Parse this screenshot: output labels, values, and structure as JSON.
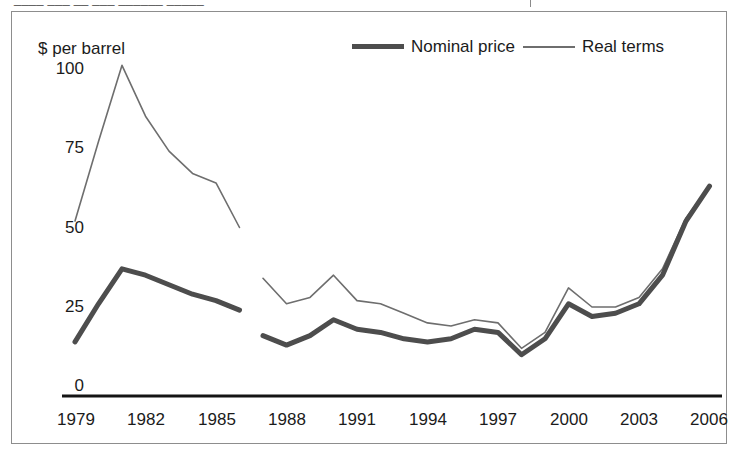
{
  "figure": {
    "clipped_header_text": "____ ___ __ ___ ______ _____",
    "background_color": "#ffffff",
    "border_color": "#8d8d8d"
  },
  "legend": {
    "position": "top-right",
    "items": [
      {
        "label": "Nominal price",
        "color": "#4d4d4d",
        "style": "thick-line",
        "swatch_icon": "thick-line-swatch-icon"
      },
      {
        "label": "Real terms",
        "color": "#6e6e6e",
        "style": "thin-line",
        "swatch_icon": "thin-line-swatch-icon"
      }
    ]
  },
  "axes": {
    "y_title": "$ per barrel",
    "y_ticks": [
      "100",
      "75",
      "50",
      "25",
      "0"
    ],
    "x_ticks": [
      "1979",
      "1982",
      "1985",
      "1988",
      "1991",
      "1994",
      "1997",
      "2000",
      "2003",
      "2006"
    ]
  },
  "chart_data": {
    "type": "line",
    "title": "",
    "subtitle": "",
    "xlabel": "",
    "ylabel": "$ per barrel",
    "ylim": [
      0,
      110
    ],
    "xlim": [
      1979,
      2006
    ],
    "ytick_values": [
      0,
      25,
      50,
      75,
      100
    ],
    "xtick_values": [
      1979,
      1982,
      1985,
      1988,
      1991,
      1994,
      1997,
      2000,
      2003,
      2006
    ],
    "grid": false,
    "legend_position": "top-right",
    "note": "Two line series plotted over two disjoint x-ranges: 1979-1986 and 1987-2006 (gap in the data between 1986 and 1987).",
    "series": [
      {
        "name": "Nominal price",
        "color": "#4d4d4d",
        "segments": [
          {
            "x": [
              1979,
              1980,
              1981,
              1982,
              1983,
              1984,
              1985,
              1986
            ],
            "values": [
              17,
              29,
              40,
              38,
              35,
              32,
              30,
              27
            ]
          },
          {
            "x": [
              1987,
              1988,
              1989,
              1990,
              1991,
              1992,
              1993,
              1994,
              1995,
              1996,
              1997,
              1998,
              1999,
              2000,
              2001,
              2002,
              2003,
              2004,
              2005,
              2006
            ],
            "values": [
              19,
              16,
              19,
              24,
              21,
              20,
              18,
              17,
              18,
              21,
              20,
              13,
              18,
              29,
              25,
              26,
              29,
              38,
              55,
              66
            ]
          }
        ]
      },
      {
        "name": "Real terms",
        "color": "#6e6e6e",
        "segments": [
          {
            "x": [
              1979,
              1980,
              1981,
              1982,
              1983,
              1984,
              1985,
              1986
            ],
            "values": [
              55,
              80,
              104,
              88,
              77,
              70,
              67,
              53
            ]
          },
          {
            "x": [
              1987,
              1988,
              1989,
              1990,
              1991,
              1992,
              1993,
              1994,
              1995,
              1996,
              1997,
              1998,
              1999,
              2000,
              2001,
              2002,
              2003,
              2004,
              2005,
              2006
            ],
            "values": [
              37,
              29,
              31,
              38,
              30,
              29,
              26,
              23,
              22,
              24,
              23,
              15,
              20,
              34,
              28,
              28,
              31,
              40,
              56,
              66
            ]
          }
        ]
      }
    ]
  },
  "plot_geometry": {
    "x_1979_px": 75,
    "px_per_year": 23.5,
    "y_zero_px": 396,
    "px_per_unit": 3.18
  }
}
